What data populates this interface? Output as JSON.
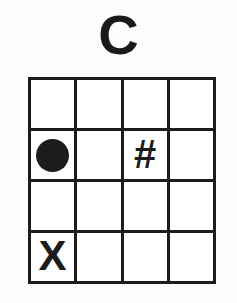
{
  "diagram": {
    "title": "C",
    "type": "chord-grid",
    "colors": {
      "ink": "#1c1c1c",
      "paper": "#fdfdfd",
      "cell": "#ffffff"
    },
    "grid": {
      "rows": 4,
      "columns": 4,
      "cells": [
        [
          {
            "mark": "empty",
            "symbol": ""
          },
          {
            "mark": "empty",
            "symbol": ""
          },
          {
            "mark": "empty",
            "symbol": ""
          },
          {
            "mark": "empty",
            "symbol": ""
          }
        ],
        [
          {
            "mark": "dot",
            "symbol": ""
          },
          {
            "mark": "empty",
            "symbol": ""
          },
          {
            "mark": "glyph",
            "symbol": "#"
          },
          {
            "mark": "empty",
            "symbol": ""
          }
        ],
        [
          {
            "mark": "empty",
            "symbol": ""
          },
          {
            "mark": "empty",
            "symbol": ""
          },
          {
            "mark": "empty",
            "symbol": ""
          },
          {
            "mark": "empty",
            "symbol": ""
          }
        ],
        [
          {
            "mark": "glyph",
            "symbol": "X"
          },
          {
            "mark": "empty",
            "symbol": ""
          },
          {
            "mark": "empty",
            "symbol": ""
          },
          {
            "mark": "empty",
            "symbol": ""
          }
        ]
      ]
    }
  }
}
